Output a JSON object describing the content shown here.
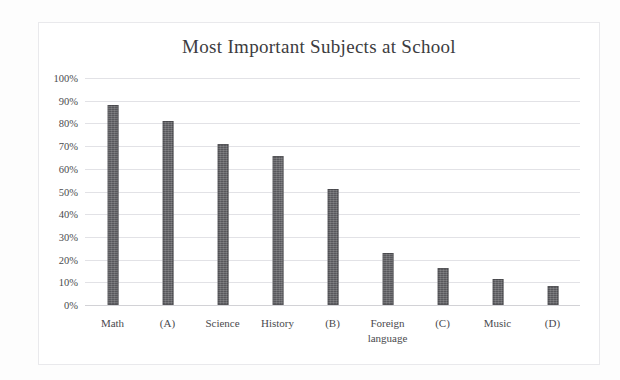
{
  "chart_data": {
    "type": "bar",
    "title": "Most Important Subjects at School",
    "xlabel": "",
    "ylabel": "",
    "categories": [
      "Math",
      "(A)",
      "Science",
      "History",
      "(B)",
      "Foreign\nlanguage",
      "(C)",
      "Music",
      "(D)"
    ],
    "values": [
      88,
      81,
      71,
      65.5,
      51,
      23,
      16.5,
      11.5,
      8.5
    ],
    "ylim": [
      0,
      100
    ],
    "ytick_labels": [
      "100%",
      "90%",
      "80%",
      "70%",
      "60%",
      "50%",
      "40%",
      "30%",
      "20%",
      "10%",
      "0%"
    ],
    "ytick_values": [
      100,
      90,
      80,
      70,
      60,
      50,
      40,
      30,
      20,
      10,
      0
    ],
    "grid": true,
    "legend": false,
    "bar_color": "#58585c",
    "gridline_color": "#e2e2e6",
    "background_color": "#ffffff",
    "text_color": "#4a4a4e"
  }
}
